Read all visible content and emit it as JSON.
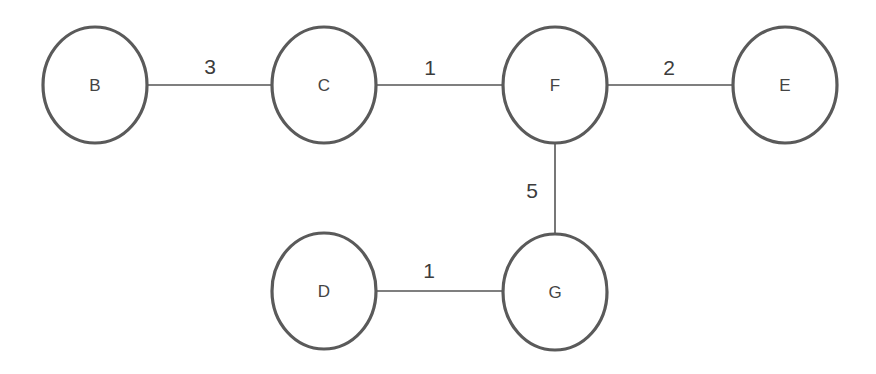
{
  "diagram": {
    "type": "weighted-undirected-graph",
    "colors": {
      "background": "#ffffff",
      "node_stroke": "#5a5a5a",
      "edge_stroke": "#555555",
      "text": "#444444"
    },
    "nodes": [
      {
        "id": "B",
        "label": "B",
        "cx": 95,
        "cy": 85,
        "rx": 52,
        "ry": 58
      },
      {
        "id": "C",
        "label": "C",
        "cx": 324,
        "cy": 85,
        "rx": 52,
        "ry": 58
      },
      {
        "id": "F",
        "label": "F",
        "cx": 555,
        "cy": 85,
        "rx": 52,
        "ry": 58
      },
      {
        "id": "E",
        "label": "E",
        "cx": 785,
        "cy": 85,
        "rx": 52,
        "ry": 58
      },
      {
        "id": "D",
        "label": "D",
        "cx": 324,
        "cy": 291,
        "rx": 52,
        "ry": 58
      },
      {
        "id": "G",
        "label": "G",
        "cx": 555,
        "cy": 292,
        "rx": 52,
        "ry": 58
      }
    ],
    "edges": [
      {
        "from": "B",
        "to": "C",
        "weight": "3",
        "x1": 147,
        "y1": 85,
        "x2": 272,
        "y2": 85,
        "lx": 210,
        "ly": 66
      },
      {
        "from": "C",
        "to": "F",
        "weight": "1",
        "x1": 376,
        "y1": 85,
        "x2": 503,
        "y2": 85,
        "lx": 430,
        "ly": 67
      },
      {
        "from": "F",
        "to": "E",
        "weight": "2",
        "x1": 607,
        "y1": 85,
        "x2": 733,
        "y2": 85,
        "lx": 669,
        "ly": 67
      },
      {
        "from": "F",
        "to": "G",
        "weight": "5",
        "x1": 555,
        "y1": 143,
        "x2": 555,
        "y2": 234,
        "lx": 532,
        "ly": 190
      },
      {
        "from": "D",
        "to": "G",
        "weight": "1",
        "x1": 376,
        "y1": 291,
        "x2": 503,
        "y2": 291,
        "lx": 429,
        "ly": 270
      }
    ]
  }
}
